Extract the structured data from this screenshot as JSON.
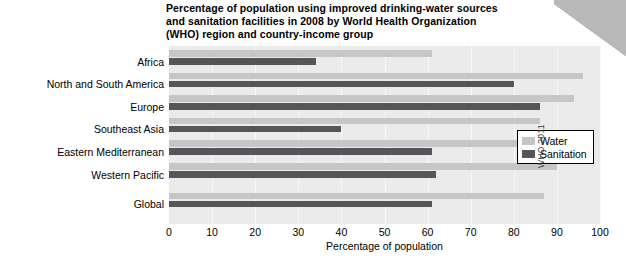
{
  "chart_data": {
    "type": "bar",
    "orientation": "horizontal",
    "title": "Percentage of population using improved drinking-water sources and sanitation facilities in 2008 by World Health Organization (WHO) region and country-income group",
    "xlabel": "Percentage of population",
    "ylabel": "",
    "xlim": [
      0,
      100
    ],
    "xticks": [
      0,
      10,
      20,
      30,
      40,
      50,
      60,
      70,
      80,
      90,
      100
    ],
    "grid": true,
    "legend_position": "right",
    "categories": [
      "Africa",
      "North and South America",
      "Europe",
      "Southeast Asia",
      "Eastern Mediterranean",
      "Western Pacific",
      "Global"
    ],
    "series": [
      {
        "name": "Water",
        "color": "#c6c6c6",
        "values": [
          61,
          96,
          94,
          86,
          83,
          90,
          87
        ]
      },
      {
        "name": "Sanitation",
        "color": "#56565a",
        "values": [
          34,
          80,
          86,
          40,
          61,
          62,
          61
        ]
      }
    ]
  },
  "legend": {
    "items": [
      {
        "label": "Water"
      },
      {
        "label": "Sanitation"
      }
    ]
  },
  "credit": "WHO 2011"
}
